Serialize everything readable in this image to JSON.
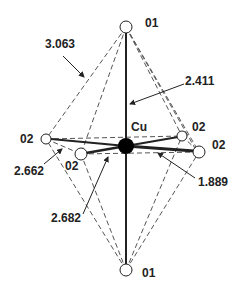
{
  "diagram": {
    "atoms": {
      "cu": {
        "label": "Cu"
      },
      "o1_top": {
        "label": "01"
      },
      "o1_bottom": {
        "label": "01"
      },
      "o2_left": {
        "label": "02"
      },
      "o2_front_left": {
        "label": "02"
      },
      "o2_back_right": {
        "label": "02"
      },
      "o2_front_right": {
        "label": "02"
      }
    },
    "distances": {
      "o1_o2_edge": "3.063",
      "cu_o1_apical": "2.411",
      "o2_o2_edge_a": "2.662",
      "o2_o2_edge_b": "2.682",
      "cu_o2_equatorial": "1.889"
    },
    "colors": {
      "line": "#222222",
      "dashed": "#555555",
      "atom_fill": "#ffffff",
      "cu_fill": "#000000"
    }
  }
}
